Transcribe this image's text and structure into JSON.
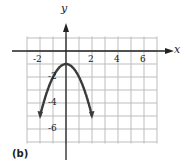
{
  "chart_data": {
    "type": "line",
    "title": "",
    "xlabel": "x",
    "ylabel": "y",
    "xlim": [
      -3,
      7
    ],
    "ylim": [
      -7,
      1
    ],
    "grid": true,
    "x_ticks": [
      "-2",
      "2",
      "4",
      "6"
    ],
    "y_ticks": [
      "-2",
      "-4",
      "-6"
    ],
    "series": [
      {
        "name": "y = -x^2 - 1",
        "x": [
          -2,
          -1.5,
          -1,
          -0.5,
          0,
          0.5,
          1,
          1.5,
          2
        ],
        "y": [
          -5,
          -3.25,
          -2,
          -1.25,
          -1,
          -1.25,
          -2,
          -3.25,
          -5
        ],
        "arrows_at_ends": true
      }
    ],
    "part_label": "(b)"
  }
}
